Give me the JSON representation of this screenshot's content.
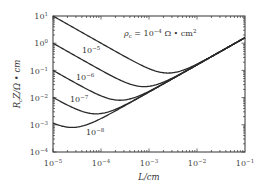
{
  "chart_data": {
    "type": "line",
    "title": "",
    "xlabel": "L/cm",
    "ylabel": "R_c Z/Ω · cm",
    "xscale": "log",
    "yscale": "log",
    "xlim": [
      1e-05,
      0.1
    ],
    "ylim": [
      0.0001,
      10.0
    ],
    "grid": false,
    "legend": "none (inline labels)",
    "x_ticks": [
      "10^-5",
      "10^-4",
      "10^-3",
      "10^-2",
      "10^-1"
    ],
    "y_ticks": [
      "10^1",
      "10^0",
      "10^-1",
      "10^-2",
      "10^-3",
      "10^-4"
    ],
    "annotation": "ρc = 10^-4 Ω · cm²",
    "model_note": "R = ρc/L + k·L with k ≈ 16 Ω",
    "k": 16,
    "x": [
      1e-05,
      3e-05,
      0.0001,
      0.0003,
      0.001,
      0.003,
      0.01,
      0.03,
      0.1
    ],
    "series": [
      {
        "name": "10^-4",
        "rho": 0.0001,
        "label": "",
        "values": [
          10.0,
          3.33,
          1.0,
          0.338,
          0.116,
          0.081,
          0.17,
          0.483,
          1.6
        ]
      },
      {
        "name": "10^-5",
        "rho": 1e-05,
        "label": "10^-5",
        "values": [
          1.0,
          0.334,
          0.102,
          0.038,
          0.026,
          0.051,
          0.161,
          0.48,
          1.6
        ]
      },
      {
        "name": "10^-6",
        "rho": 1e-06,
        "label": "10^-6",
        "values": [
          0.1,
          0.034,
          0.012,
          0.008,
          0.017,
          0.048,
          0.16,
          0.48,
          1.6
        ]
      },
      {
        "name": "10^-7",
        "rho": 1e-07,
        "label": "10^-7",
        "values": [
          0.0102,
          0.0038,
          0.0026,
          0.0051,
          0.0161,
          0.048,
          0.16,
          0.48,
          1.6
        ]
      },
      {
        "name": "10^-8",
        "rho": 1e-08,
        "label": "10^-8",
        "values": [
          0.00116,
          0.00081,
          0.0017,
          0.0048,
          0.016,
          0.048,
          0.16,
          0.48,
          1.6
        ]
      }
    ]
  },
  "labels": {
    "annot_prefix": "ρ",
    "annot_sub": "c",
    "annot_mid": " = 10",
    "annot_exp": "−4",
    "annot_unit": " Ω • cm",
    "annot_unit_exp": "2",
    "x_title": "L/cm",
    "y_title": "R",
    "y_title_sub": "c",
    "y_title_rest": "Z/Ω • cm",
    "tick_base": "10",
    "x_tick_exps": [
      "−5",
      "−4",
      "−3",
      "−2",
      "−1"
    ],
    "y_tick_exps": [
      "1",
      "0",
      "−1",
      "−2",
      "−3",
      "−4"
    ],
    "curve_label_exps": [
      "−5",
      "−6",
      "−7",
      "−8"
    ]
  }
}
